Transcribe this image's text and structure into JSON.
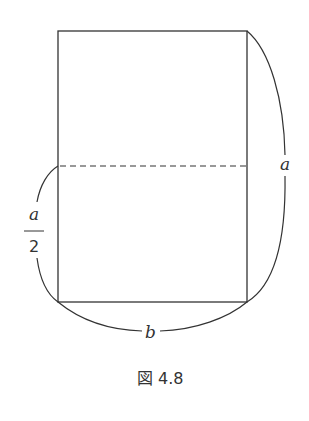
{
  "figure": {
    "caption": "図 4.8",
    "labels": {
      "right_side": "a",
      "left_numerator": "a",
      "left_denominator": "2",
      "bottom": "b"
    },
    "colors": {
      "stroke": "#333333",
      "background": "#ffffff"
    }
  }
}
